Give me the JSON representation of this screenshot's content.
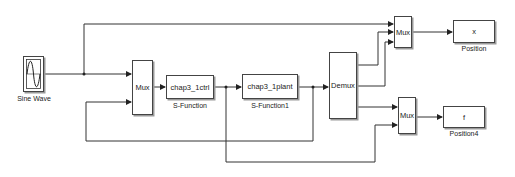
{
  "diagram": {
    "type": "simulink-model",
    "blocks": {
      "sine": {
        "label": "Sine Wave"
      },
      "mux1": {
        "text": "Mux"
      },
      "ctrl": {
        "text": "chap3_1ctrl",
        "label": "S-Function"
      },
      "plant": {
        "text": "chap3_1plant",
        "label": "S-Function1"
      },
      "demux": {
        "text": "Demux"
      },
      "mux_top": {
        "text": "Mux"
      },
      "mux_bottom": {
        "text": "Mux"
      },
      "scope_x": {
        "text": "x",
        "label": "Position"
      },
      "scope_f": {
        "text": "f",
        "label": "Position4"
      }
    },
    "colors": {
      "line": "#222222",
      "block_border": "#444444",
      "shadow": "#9a9a9a"
    }
  }
}
